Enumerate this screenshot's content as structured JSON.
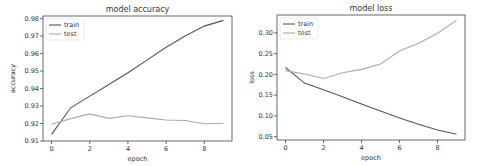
{
  "colors": {
    "train": "#555555",
    "test": "#aaaaaa",
    "axis": "#444444"
  },
  "chart_data": [
    {
      "type": "line",
      "title": "model accuracy",
      "xlabel": "epoch",
      "ylabel": "accuracy",
      "x": [
        0,
        1,
        2,
        3,
        4,
        5,
        6,
        7,
        8,
        9
      ],
      "xticks": [
        0,
        2,
        4,
        6,
        8
      ],
      "yticks": [
        0.91,
        0.92,
        0.93,
        0.94,
        0.95,
        0.96,
        0.97,
        0.98
      ],
      "ytick_labels": [
        "0.91",
        "0.92",
        "0.93",
        "0.94",
        "0.95",
        "0.96",
        "0.97",
        "0.98"
      ],
      "ylim": [
        0.91,
        0.9815
      ],
      "xlim": [
        -0.45,
        9.45
      ],
      "legend_position": "upper left",
      "grid": false,
      "series": [
        {
          "name": "train",
          "values": [
            0.9138,
            0.929,
            0.9357,
            0.9423,
            0.949,
            0.9563,
            0.9636,
            0.97,
            0.9757,
            0.979
          ]
        },
        {
          "name": "test",
          "values": [
            0.9196,
            0.9228,
            0.9255,
            0.9229,
            0.9245,
            0.9232,
            0.922,
            0.9217,
            0.9199,
            0.9202
          ]
        }
      ]
    },
    {
      "type": "line",
      "title": "model loss",
      "xlabel": "epoch",
      "ylabel": "loss",
      "x": [
        0,
        1,
        2,
        3,
        4,
        5,
        6,
        7,
        8,
        9
      ],
      "xticks": [
        0,
        2,
        4,
        6,
        8
      ],
      "yticks": [
        0.05,
        0.1,
        0.15,
        0.2,
        0.25,
        0.3
      ],
      "ytick_labels": [
        "0.05",
        "0.10",
        "0.15",
        "0.20",
        "0.25",
        "0.30"
      ],
      "ylim": [
        0.042,
        0.343
      ],
      "xlim": [
        -0.45,
        9.45
      ],
      "legend_position": "upper left",
      "grid": false,
      "series": [
        {
          "name": "train",
          "values": [
            0.2167,
            0.179,
            0.163,
            0.146,
            0.129,
            0.112,
            0.095,
            0.08,
            0.066,
            0.056
          ]
        },
        {
          "name": "test",
          "values": [
            0.209,
            0.201,
            0.19,
            0.204,
            0.212,
            0.225,
            0.256,
            0.275,
            0.299,
            0.33
          ]
        }
      ]
    }
  ]
}
